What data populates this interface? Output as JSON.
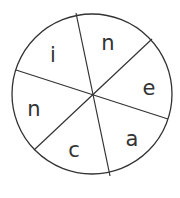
{
  "diagram": {
    "type": "letter-wheel",
    "colors": {
      "stroke": "#333333",
      "background": "#ffffff",
      "text": "#333333"
    },
    "segments": [
      {
        "letter": "n",
        "position": "top-right"
      },
      {
        "letter": "e",
        "position": "right"
      },
      {
        "letter": "a",
        "position": "bottom-right"
      },
      {
        "letter": "c",
        "position": "bottom-left"
      },
      {
        "letter": "n",
        "position": "left"
      },
      {
        "letter": "i",
        "position": "top-left"
      }
    ]
  }
}
